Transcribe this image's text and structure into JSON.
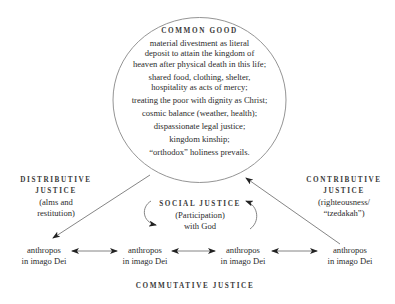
{
  "diagram": {
    "common_good": {
      "title": "COMMON GOOD",
      "items": [
        "material divestment as literal deposit to attain the kingdom of heaven after physical death in this life;",
        "shared food, clothing, shelter, hospitality as acts of mercy;",
        "treating the poor with dignity as Christ;",
        "cosmic balance (weather, health);",
        "dispassionate legal justice;",
        "kingdom kinship;",
        "“orthodox” holiness prevails."
      ],
      "items_lines": [
        [
          "material divestment as literal",
          "deposit to attain the kingdom of",
          "heaven after physical death in this life;"
        ],
        [
          "shared food, clothing, shelter,",
          "hospitality as acts of mercy;"
        ],
        [
          "treating the poor with dignity as Christ;"
        ],
        [
          "cosmic balance (weather, health);"
        ],
        [
          "dispassionate legal justice;"
        ],
        [
          "kingdom kinship;"
        ],
        [
          "“orthodox” holiness prevails."
        ]
      ]
    },
    "distributive_justice": {
      "title_line1": "DISTRIBUTIVE",
      "title_line2": "JUSTICE",
      "desc_line1": "(alms and",
      "desc_line2": "restitution)"
    },
    "contributive_justice": {
      "title_line1": "CONTRIBUTIVE",
      "title_line2": "JUSTICE",
      "desc_line1": "(righteousness/",
      "desc_line2": "“tzedakah”)"
    },
    "social_justice": {
      "title": "SOCIAL JUSTICE",
      "desc_line1": "(Participation)",
      "desc_line2": "with God"
    },
    "nodes": [
      {
        "line1": "anthropos",
        "line2": "in imago Dei"
      },
      {
        "line1": "anthropos",
        "line2": "in imago Dei"
      },
      {
        "line1": "anthropos",
        "line2": "in imago Dei"
      },
      {
        "line1": "anthropos",
        "line2": "in imago Dei"
      }
    ],
    "commutative_justice": {
      "title": "COMMUTATIVE JUSTICE"
    },
    "colors": {
      "text": "#2b2b2b",
      "lines": "#777777",
      "background": "#ffffff"
    }
  }
}
